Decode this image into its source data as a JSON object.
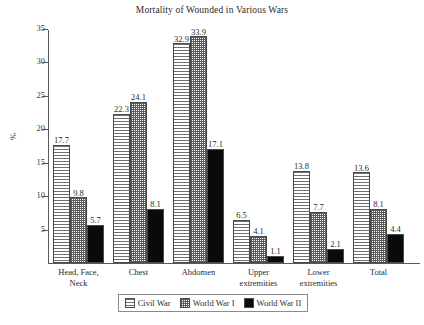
{
  "chart_data": {
    "type": "bar",
    "title": "Mortality of Wounded in Various Wars",
    "xlabel": "",
    "ylabel": "%",
    "ylim": [
      0,
      35
    ],
    "yticks": [
      5,
      10,
      15,
      20,
      25,
      30,
      35
    ],
    "grid": false,
    "legend_position": "bottom",
    "categories": [
      "Head, Face, Neck",
      "Chest",
      "Abdomen",
      "Upper extremities",
      "Lower extremities",
      "Total"
    ],
    "category_lines": [
      [
        "Head, Face,",
        "Neck"
      ],
      [
        "Chest"
      ],
      [
        "Abdomen"
      ],
      [
        "Upper",
        "extremities"
      ],
      [
        "Lower",
        "extremities"
      ],
      [
        "Total"
      ]
    ],
    "series": [
      {
        "name": "Civil War",
        "pattern": "horizontal-lines",
        "values": [
          17.7,
          22.3,
          32.9,
          6.5,
          13.8,
          13.6
        ]
      },
      {
        "name": "World War I",
        "pattern": "cross-hatch",
        "values": [
          9.8,
          24.1,
          33.9,
          4.1,
          7.7,
          8.1
        ]
      },
      {
        "name": "World War II",
        "pattern": "solid-black",
        "values": [
          5.7,
          8.1,
          17.1,
          1.1,
          2.1,
          4.4
        ]
      }
    ],
    "value_labels": [
      [
        "17.7",
        "9.8",
        "5.7"
      ],
      [
        "22.3",
        "24.1",
        "8.1"
      ],
      [
        "32.9",
        "33.9",
        "17.1"
      ],
      [
        "6.5",
        "4.1",
        "1.1"
      ],
      [
        "13.8",
        "7.7",
        "2.1"
      ],
      [
        "13.6",
        "8.1",
        "4.4"
      ]
    ],
    "ytick_labels": [
      "5",
      "10",
      "15",
      "20",
      "25",
      "30",
      "35"
    ],
    "colors": {
      "axis": "#595959",
      "bar_outline": "#4a4a4a",
      "hatch": "#6f6f6f",
      "solid": "#0a0a0a",
      "text": "#2b2b2b",
      "background": "#ffffff"
    }
  },
  "legend": {
    "items": [
      {
        "label": "Civil War",
        "pattern": "horizontal-lines"
      },
      {
        "label": "World War I",
        "pattern": "cross-hatch"
      },
      {
        "label": "World War II",
        "pattern": "solid-black"
      }
    ]
  }
}
